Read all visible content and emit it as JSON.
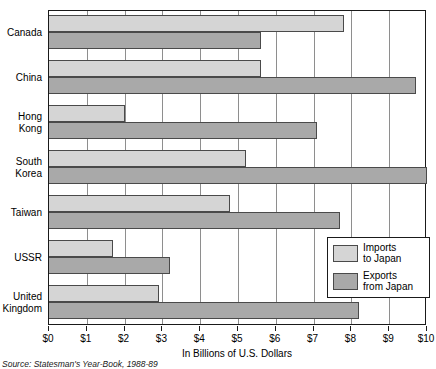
{
  "chart_data": {
    "type": "bar",
    "orientation": "horizontal",
    "title": "",
    "xlabel": "In Billions of U.S. Dollars",
    "ylabel": "",
    "xlim": [
      0,
      10
    ],
    "xticks": [
      0,
      1,
      2,
      3,
      4,
      5,
      6,
      7,
      8,
      9,
      10
    ],
    "xtick_labels": [
      "$0",
      "$1",
      "$2",
      "$3",
      "$4",
      "$5",
      "$6",
      "$7",
      "$8",
      "$9",
      "$10"
    ],
    "grid": true,
    "grid_axis": "x",
    "legend_position": "lower right inside",
    "categories": [
      "Canada",
      "China",
      "Hong\nKong",
      "South\nKorea",
      "Taiwan",
      "USSR",
      "United\nKingdom"
    ],
    "series": [
      {
        "name": "Imports\nto Japan",
        "color": "#d5d5d5",
        "values": [
          7.8,
          5.6,
          2.0,
          5.2,
          4.8,
          1.7,
          2.9
        ]
      },
      {
        "name": "Exports\nfrom Japan",
        "color": "#a9a9a9",
        "values": [
          5.6,
          9.7,
          7.1,
          10.0,
          7.7,
          3.2,
          8.2
        ]
      }
    ],
    "source": "Source: Statesman's Year-Book, 1988-89"
  },
  "legend": {
    "items": [
      {
        "label": "Imports\nto Japan"
      },
      {
        "label": "Exports\nfrom Japan"
      }
    ]
  }
}
